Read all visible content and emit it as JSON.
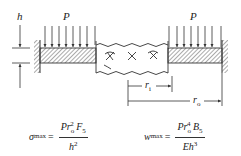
{
  "diagram": {
    "labels": {
      "thickness": "h",
      "pressure_left": "P",
      "pressure_right": "P",
      "inner_radius": "r",
      "inner_radius_sub": "i",
      "outer_radius": "r",
      "outer_radius_sub": "o"
    },
    "formulas": {
      "stress": {
        "lhs_symbol": "σ",
        "lhs_sub": "max",
        "equals": "=",
        "num_P": "P",
        "num_r": "r",
        "num_r_sub": "o",
        "num_r_sup": "2",
        "num_F": "F",
        "num_F_sub": "5",
        "den_h": "h",
        "den_h_sup": "2"
      },
      "deflection": {
        "lhs_symbol": "w",
        "lhs_sub": "max",
        "equals": "=",
        "num_P": "P",
        "num_r": "r",
        "num_r_sub": "o",
        "num_r_sup": "4",
        "num_B": "B",
        "num_B_sub": "5",
        "den_E": "E",
        "den_h": "h",
        "den_h_sup": "3"
      }
    },
    "colors": {
      "line": "#333333",
      "background": "#ffffff"
    }
  }
}
